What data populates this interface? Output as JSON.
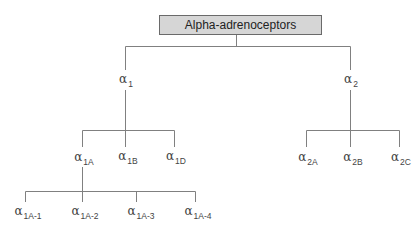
{
  "diagram": {
    "root": {
      "label": "Alpha-adrenoceptors"
    },
    "alpha_symbol": "α",
    "level1": [
      {
        "sub": "1"
      },
      {
        "sub": "2"
      }
    ],
    "level2_alpha1": [
      {
        "sub": "1A"
      },
      {
        "sub": "1B"
      },
      {
        "sub": "1D"
      }
    ],
    "level2_alpha2": [
      {
        "sub": "2A"
      },
      {
        "sub": "2B"
      },
      {
        "sub": "2C"
      }
    ],
    "level3_alpha1A": [
      {
        "sub": "1A-1"
      },
      {
        "sub": "1A-2"
      },
      {
        "sub": "1A-3"
      },
      {
        "sub": "1A-4"
      }
    ],
    "colors": {
      "box_fill": "#d6d6d6",
      "box_border": "#6a6a6a",
      "line": "#777777"
    }
  }
}
